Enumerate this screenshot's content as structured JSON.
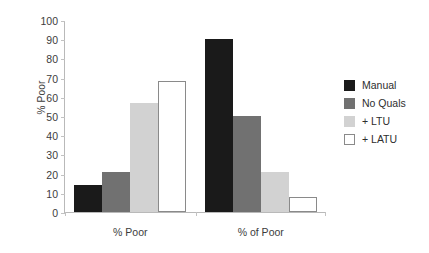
{
  "chart_data": {
    "type": "bar",
    "title": "",
    "xlabel": "",
    "ylabel": "% Poor",
    "ylim": [
      0,
      100
    ],
    "yticks": [
      0,
      10,
      20,
      30,
      40,
      50,
      60,
      70,
      80,
      90,
      100
    ],
    "grid": false,
    "legend_position": "right",
    "categories": [
      "% Poor",
      "% of Poor"
    ],
    "series": [
      {
        "name": "Manual",
        "color": "#1a1a1a",
        "border": "#1a1a1a",
        "values": [
          14,
          90
        ]
      },
      {
        "name": "No Quals",
        "color": "#717171",
        "border": "#717171",
        "values": [
          21,
          50
        ]
      },
      {
        "name": "+ LTU",
        "color": "#d2d2d2",
        "border": "#d2d2d2",
        "values": [
          57,
          21
        ]
      },
      {
        "name": "+ LATU",
        "color": "#ffffff",
        "border": "#8a8a8a",
        "values": [
          68,
          8
        ]
      }
    ]
  }
}
